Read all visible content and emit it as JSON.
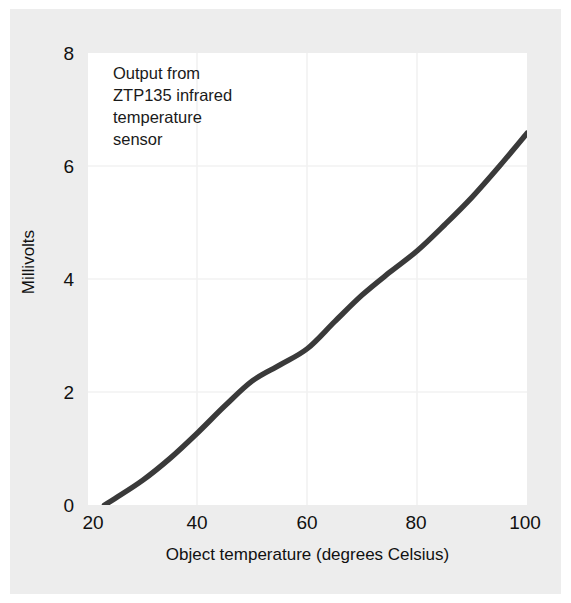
{
  "chart_data": {
    "type": "line",
    "title": "",
    "annotation": "Output from\nZTP135 infrared\ntemperature\nsensor",
    "xlabel": "Object temperature (degrees Celsius)",
    "ylabel": "Millivolts",
    "xlim": [
      20,
      100
    ],
    "ylim": [
      0,
      8
    ],
    "xticks": [
      "20",
      "40",
      "60",
      "80",
      "100"
    ],
    "yticks": [
      "0",
      "2",
      "4",
      "6",
      "8"
    ],
    "grid": true,
    "legend": "none",
    "line_color": "#3a3a3a",
    "background_color": "#ededed",
    "plot_background_color": "#ffffff",
    "grid_color": "#f2f2f2",
    "series": [
      {
        "name": "ZTP135 output",
        "x": [
          23,
          25,
          30,
          35,
          40,
          45,
          50,
          55,
          60,
          65,
          70,
          75,
          80,
          85,
          90,
          95,
          100
        ],
        "values": [
          0.0,
          0.12,
          0.44,
          0.83,
          1.28,
          1.76,
          2.2,
          2.48,
          2.77,
          3.25,
          3.72,
          4.12,
          4.5,
          4.96,
          5.45,
          6.0,
          6.58
        ]
      }
    ]
  }
}
